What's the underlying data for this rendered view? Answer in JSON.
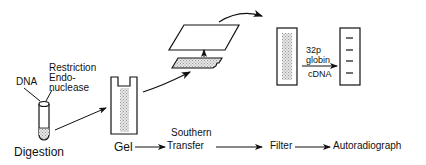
{
  "diagram": {
    "labels": {
      "dna": "DNA",
      "restriction_line1": "Restriction",
      "restriction_line2": "Endo-",
      "restriction_line3": "nuclease",
      "digestion": "Digestion",
      "gel": "Gel",
      "southern_line1": "Southern",
      "southern_line2": "Transfer",
      "filter": "Filter",
      "autoradiograph": "Autoradiograph",
      "probe_line1": "32p",
      "probe_line2": "globin",
      "probe_line3": "cDNA"
    },
    "steps": [
      "Digestion",
      "Gel",
      "Southern Transfer",
      "Filter",
      "Autoradiograph"
    ],
    "autoradiograph_bands": 4,
    "colors": {
      "line": "#111111",
      "shading": "#bdbdbd"
    }
  }
}
